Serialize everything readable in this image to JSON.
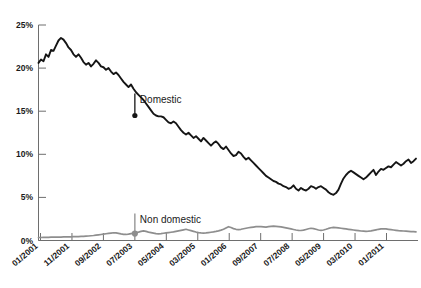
{
  "chart_data": {
    "type": "line",
    "title": "",
    "subtitle": "",
    "xlabel": "",
    "ylabel": "",
    "ylim": [
      0,
      25
    ],
    "yticks": [
      "0%",
      "5%",
      "10%",
      "15%",
      "20%",
      "25%"
    ],
    "ytick_values": [
      0,
      5,
      10,
      15,
      20,
      25
    ],
    "xticks": [
      "01/2001",
      "11/2001",
      "09/2002",
      "07/2003",
      "05/2004",
      "03/2005",
      "01/2006",
      "09/2007",
      "07/2008",
      "05/2009",
      "03/2010",
      "01/2011"
    ],
    "grid": false,
    "legend_position": "inline-annotations",
    "annotations": [
      {
        "label": "Domestic",
        "series": "Domestic",
        "x": "07/2003",
        "y": 14.5,
        "color": "#151515"
      },
      {
        "label": "Non domestic",
        "series": "Non domestic",
        "x": "07/2003",
        "y": 0.8,
        "color": "#8e8e8e"
      }
    ],
    "colors": {
      "domestic": "#151515",
      "non_domestic": "#8e8e8e",
      "axis": "#6e6e6e",
      "background": "#ffffff",
      "text": "#1a1a1a"
    },
    "series": [
      {
        "name": "Domestic",
        "color": "#151515",
        "values": [
          20.6,
          21.0,
          20.8,
          21.6,
          21.3,
          22.1,
          22.0,
          22.6,
          23.2,
          23.5,
          23.3,
          22.9,
          22.4,
          22.1,
          21.6,
          21.3,
          21.6,
          21.2,
          20.7,
          20.4,
          20.6,
          20.2,
          20.5,
          20.9,
          20.6,
          20.2,
          20.1,
          19.8,
          20.0,
          19.6,
          19.3,
          19.5,
          19.2,
          18.8,
          18.4,
          18.1,
          17.8,
          18.1,
          17.6,
          17.2,
          16.9,
          16.6,
          16.3,
          15.9,
          15.5,
          15.1,
          14.7,
          14.5,
          14.4,
          14.4,
          14.3,
          14.0,
          13.7,
          13.6,
          13.8,
          13.6,
          13.2,
          12.8,
          12.5,
          12.3,
          12.5,
          12.2,
          11.9,
          12.1,
          11.8,
          11.5,
          11.9,
          11.6,
          11.3,
          11.0,
          11.3,
          11.5,
          11.2,
          10.8,
          10.6,
          10.9,
          10.5,
          10.1,
          9.8,
          9.9,
          10.3,
          10.1,
          9.7,
          9.4,
          9.6,
          9.3,
          9.0,
          8.7,
          8.4,
          8.1,
          7.8,
          7.5,
          7.3,
          7.1,
          6.9,
          6.8,
          6.6,
          6.5,
          6.3,
          6.2,
          6.0,
          6.1,
          6.4,
          6.0,
          5.8,
          6.1,
          5.9,
          5.8,
          6.0,
          6.3,
          6.2,
          6.0,
          6.2,
          6.3,
          6.1,
          5.9,
          5.6,
          5.4,
          5.3,
          5.5,
          5.9,
          6.6,
          7.2,
          7.6,
          7.9,
          8.1,
          7.9,
          7.7,
          7.5,
          7.3,
          7.1,
          7.3,
          7.6,
          7.9,
          8.2,
          7.6,
          8.0,
          8.3,
          8.2,
          8.4,
          8.6,
          8.5,
          8.8,
          9.1,
          8.9,
          8.7,
          8.9,
          9.2,
          9.4,
          9.0,
          9.2,
          9.5
        ]
      },
      {
        "name": "Non domestic",
        "color": "#8e8e8e",
        "values": [
          0.35,
          0.35,
          0.36,
          0.36,
          0.37,
          0.38,
          0.38,
          0.39,
          0.4,
          0.4,
          0.41,
          0.42,
          0.42,
          0.43,
          0.44,
          0.45,
          0.46,
          0.47,
          0.48,
          0.5,
          0.52,
          0.55,
          0.58,
          0.62,
          0.66,
          0.7,
          0.74,
          0.78,
          0.82,
          0.86,
          0.9,
          0.88,
          0.82,
          0.76,
          0.72,
          0.7,
          0.74,
          0.8,
          0.86,
          0.92,
          0.98,
          1.05,
          1.12,
          1.05,
          0.98,
          0.92,
          0.86,
          0.8,
          0.78,
          0.8,
          0.84,
          0.88,
          0.92,
          0.96,
          1.0,
          1.06,
          1.12,
          1.18,
          1.24,
          1.3,
          1.22,
          1.14,
          1.06,
          0.98,
          0.92,
          0.88,
          0.86,
          0.88,
          0.92,
          0.96,
          1.0,
          1.05,
          1.12,
          1.2,
          1.3,
          1.45,
          1.6,
          1.5,
          1.38,
          1.3,
          1.26,
          1.3,
          1.36,
          1.42,
          1.48,
          1.52,
          1.56,
          1.6,
          1.62,
          1.6,
          1.58,
          1.56,
          1.6,
          1.64,
          1.66,
          1.64,
          1.62,
          1.58,
          1.52,
          1.46,
          1.4,
          1.34,
          1.28,
          1.22,
          1.18,
          1.16,
          1.2,
          1.28,
          1.36,
          1.42,
          1.38,
          1.3,
          1.22,
          1.18,
          1.22,
          1.3,
          1.4,
          1.48,
          1.52,
          1.5,
          1.46,
          1.42,
          1.38,
          1.34,
          1.3,
          1.26,
          1.22,
          1.18,
          1.14,
          1.1,
          1.08,
          1.06,
          1.08,
          1.12,
          1.18,
          1.24,
          1.3,
          1.34,
          1.36,
          1.34,
          1.3,
          1.26,
          1.22,
          1.18,
          1.14,
          1.12,
          1.1,
          1.08,
          1.06,
          1.04,
          1.02,
          1.0
        ]
      }
    ]
  }
}
